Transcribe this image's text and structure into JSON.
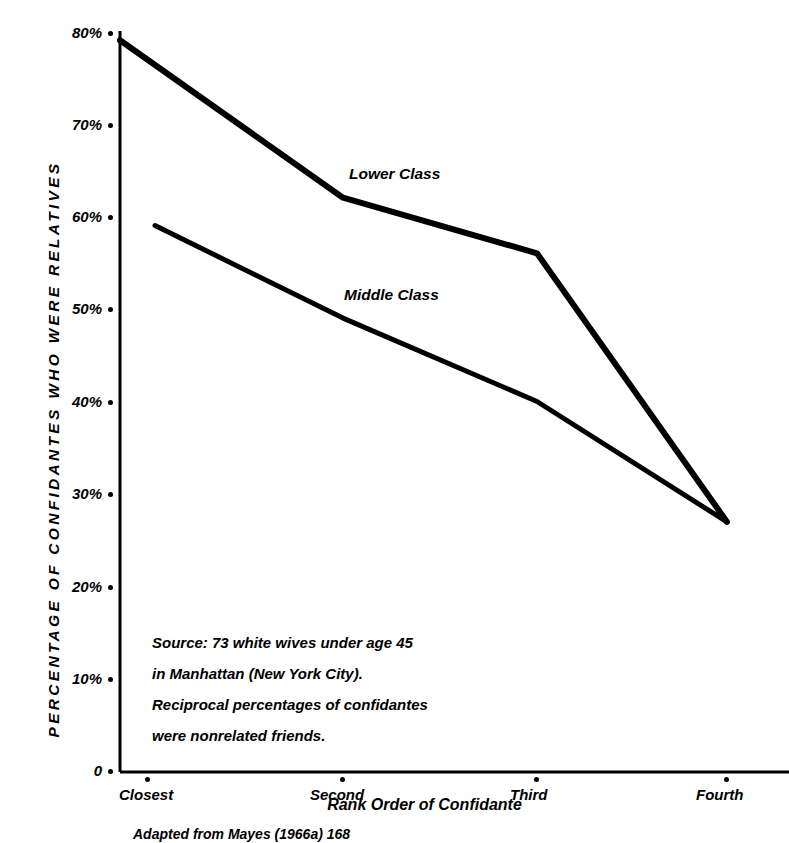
{
  "chart_data": {
    "type": "line",
    "title": "",
    "xlabel": "Rank Order of Confidante",
    "ylabel": "PERCENTAGE OF CONFIDANTES WHO WERE RELATIVES",
    "categories": [
      "Closest",
      "Second",
      "Third",
      "Fourth"
    ],
    "ytick_labels": [
      "80%",
      "70%",
      "60%",
      "50%",
      "40%",
      "30%",
      "20%",
      "10%",
      "0"
    ],
    "ytick_values": [
      80,
      70,
      60,
      50,
      40,
      30,
      20,
      10,
      0
    ],
    "ylim": [
      0,
      80
    ],
    "grid": false,
    "legend_position": "inline-annotation",
    "series": [
      {
        "name": "Lower Class",
        "values": [
          79,
          62,
          56,
          27
        ]
      },
      {
        "name": "Middle Class",
        "values": [
          59,
          49,
          40,
          27
        ]
      }
    ],
    "annotations": [
      {
        "text": "Lower Class"
      },
      {
        "text": "Middle Class"
      }
    ]
  },
  "source_note": {
    "line1": "Source: 73 white wives under age 45",
    "line2": "in Manhattan (New York City).",
    "line3": "Reciprocal percentages of confidantes",
    "line4": "were nonrelated friends."
  },
  "caption": "Adapted from Mayes (1966a) 168",
  "colors": {
    "ink": "#000000",
    "background": "#ffffff"
  }
}
